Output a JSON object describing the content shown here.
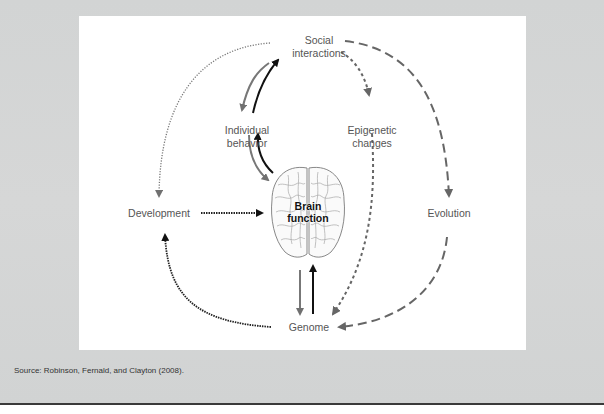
{
  "figure": {
    "nodes": {
      "social_interactions": "Social\ninteractions",
      "individual_behavior": "Individual\nbehavior",
      "epigenetic_changes": "Epigenetic\nchanges",
      "development": "Development",
      "brain_function": "Brain\nfunction",
      "evolution": "Evolution",
      "genome": "Genome"
    },
    "edges": [
      {
        "from": "Social interactions",
        "to": "Individual behavior",
        "style": "solid",
        "color": "#777777"
      },
      {
        "from": "Individual behavior",
        "to": "Social interactions",
        "style": "solid",
        "color": "#111111"
      },
      {
        "from": "Individual behavior",
        "to": "Brain function",
        "style": "solid",
        "color": "#777777"
      },
      {
        "from": "Brain function",
        "to": "Individual behavior",
        "style": "solid",
        "color": "#111111"
      },
      {
        "from": "Social interactions",
        "to": "Epigenetic changes",
        "style": "short-dash",
        "color": "#666666"
      },
      {
        "from": "Epigenetic changes",
        "to": "Genome",
        "style": "short-dash",
        "color": "#666666"
      },
      {
        "from": "Social interactions",
        "to": "Development",
        "style": "dotted",
        "color": "#777777"
      },
      {
        "from": "Development",
        "to": "Brain function",
        "style": "dotted",
        "color": "#222222"
      },
      {
        "from": "Genome",
        "to": "Development",
        "style": "dotted",
        "color": "#222222"
      },
      {
        "from": "Brain function",
        "to": "Genome",
        "style": "solid",
        "color": "#777777"
      },
      {
        "from": "Genome",
        "to": "Brain function",
        "style": "solid",
        "color": "#111111"
      },
      {
        "from": "Social interactions",
        "to": "Evolution",
        "style": "long-dash",
        "color": "#666666"
      },
      {
        "from": "Evolution",
        "to": "Genome",
        "style": "long-dash",
        "color": "#666666"
      }
    ]
  },
  "source": "Source: Robinson, Fernald, and Clayton (2008)."
}
